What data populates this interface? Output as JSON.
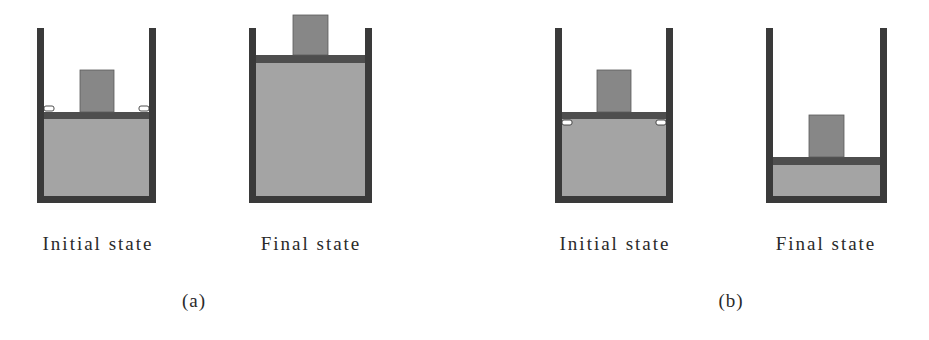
{
  "figure": {
    "colors": {
      "wall": "#3a3a3a",
      "piston": "#4e4e4e",
      "gas": "#a4a4a4",
      "weight": "#878787",
      "stop_fill": "#ffffff",
      "stop_stroke": "#3a3a3a"
    },
    "panels": [
      {
        "label": "(a)",
        "label_x": 194,
        "label_y": 290,
        "cylinders": [
          {
            "caption": "Initial state",
            "caption_x": 98,
            "caption_y": 233,
            "left": 37,
            "right": 156,
            "top": 28,
            "bottom": 203,
            "wall": 7,
            "piston_y": 112,
            "piston_h": 7,
            "weight": {
              "x": 80,
              "w": 34,
              "h": 42
            },
            "stops": {
              "y": 106,
              "side": "above"
            }
          },
          {
            "caption": "Final state",
            "caption_x": 311,
            "caption_y": 233,
            "left": 249,
            "right": 372,
            "top": 28,
            "bottom": 203,
            "wall": 7,
            "piston_y": 55,
            "piston_h": 8,
            "weight": {
              "x": 293,
              "w": 35,
              "h": 40
            },
            "stops": null
          }
        ]
      },
      {
        "label": "(b)",
        "label_x": 731,
        "label_y": 290,
        "cylinders": [
          {
            "caption": "Initial state",
            "caption_x": 615,
            "caption_y": 233,
            "left": 555,
            "right": 673,
            "top": 28,
            "bottom": 203,
            "wall": 7,
            "piston_y": 112,
            "piston_h": 7,
            "weight": {
              "x": 597,
              "w": 34,
              "h": 42
            },
            "stops": {
              "y": 120,
              "side": "below"
            }
          },
          {
            "caption": "Final state",
            "caption_x": 826,
            "caption_y": 233,
            "left": 766,
            "right": 887,
            "top": 28,
            "bottom": 203,
            "wall": 7,
            "piston_y": 157,
            "piston_h": 8,
            "weight": {
              "x": 809,
              "w": 35,
              "h": 42
            },
            "stops": null
          }
        ]
      }
    ]
  }
}
